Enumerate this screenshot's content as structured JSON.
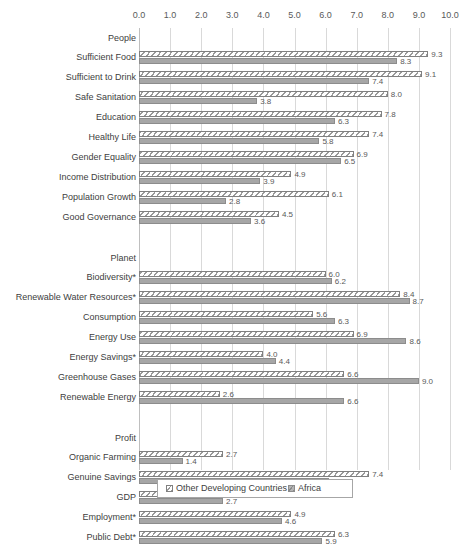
{
  "chart_data": {
    "type": "bar",
    "orientation": "horizontal",
    "title": "",
    "xlabel": "",
    "ylabel": "",
    "xlim": [
      0,
      10
    ],
    "xticks": [
      "0.0",
      "1.0",
      "2.0",
      "3.0",
      "4.0",
      "5.0",
      "6.0",
      "7.0",
      "8.0",
      "9.0",
      "10.0"
    ],
    "grid": true,
    "legend_position": "bottom",
    "series": [
      {
        "name": "Other Developing Countries",
        "pattern": "diagonal-hatch"
      },
      {
        "name": "Africa",
        "pattern": "solid-gray"
      }
    ],
    "groups": [
      {
        "label": "People",
        "categories": [
          {
            "label": "Sufficient Food",
            "values": [
              9.3,
              8.3
            ],
            "value_labels": [
              "9.3",
              "8.3"
            ]
          },
          {
            "label": "Sufficient to Drink",
            "values": [
              9.1,
              7.4
            ],
            "value_labels": [
              "9.1",
              "7.4"
            ]
          },
          {
            "label": "Safe Sanitation",
            "values": [
              8.0,
              3.8
            ],
            "value_labels": [
              "8.0",
              "3.8"
            ]
          },
          {
            "label": "Education",
            "values": [
              7.8,
              6.3
            ],
            "value_labels": [
              "7.8",
              "6.3"
            ]
          },
          {
            "label": "Healthy Life",
            "values": [
              7.4,
              5.8
            ],
            "value_labels": [
              "7.4",
              "5.8"
            ]
          },
          {
            "label": "Gender Equality",
            "values": [
              6.9,
              6.5
            ],
            "value_labels": [
              "6.9",
              "6.5"
            ]
          },
          {
            "label": "Income Distribution",
            "values": [
              4.9,
              3.9
            ],
            "value_labels": [
              "4.9",
              "3.9"
            ]
          },
          {
            "label": "Population Growth",
            "values": [
              6.1,
              2.8
            ],
            "value_labels": [
              "6.1",
              "2.8"
            ]
          },
          {
            "label": "Good Governance",
            "values": [
              4.5,
              3.6
            ],
            "value_labels": [
              "4.5",
              "3.6"
            ]
          }
        ]
      },
      {
        "label": "Planet",
        "categories": [
          {
            "label": "Biodiversity*",
            "values": [
              6.0,
              6.2
            ],
            "value_labels": [
              "6.0",
              "6.2"
            ]
          },
          {
            "label": "Renewable Water Resources*",
            "values": [
              8.4,
              8.7
            ],
            "value_labels": [
              "8.4",
              "8.7"
            ]
          },
          {
            "label": "Consumption",
            "values": [
              5.6,
              6.3
            ],
            "value_labels": [
              "5.6",
              "6.3"
            ]
          },
          {
            "label": "Energy Use",
            "values": [
              6.9,
              8.6
            ],
            "value_labels": [
              "6.9",
              "8.6"
            ]
          },
          {
            "label": "Energy Savings*",
            "values": [
              4.0,
              4.4
            ],
            "value_labels": [
              "4.0",
              "4.4"
            ]
          },
          {
            "label": "Greenhouse Gases",
            "values": [
              6.6,
              9.0
            ],
            "value_labels": [
              "6.6",
              "9.0"
            ]
          },
          {
            "label": "Renewable Energy",
            "values": [
              2.6,
              6.6
            ],
            "value_labels": [
              "2.6",
              "6.6"
            ]
          }
        ]
      },
      {
        "label": "Profit",
        "categories": [
          {
            "label": "Organic Farming",
            "values": [
              2.7,
              1.4
            ],
            "value_labels": [
              "2.7",
              "1.4"
            ]
          },
          {
            "label": "Genuine Savings",
            "values": [
              7.4,
              6.1
            ],
            "value_labels": [
              "7.4",
              "6.1"
            ]
          },
          {
            "label": "GDP",
            "values": [
              5.6,
              2.7
            ],
            "value_labels": [
              "5.6",
              "2.7"
            ]
          },
          {
            "label": "Employment*",
            "values": [
              4.9,
              4.6
            ],
            "value_labels": [
              "4.9",
              "4.6"
            ]
          },
          {
            "label": "Public Debt*",
            "values": [
              6.3,
              5.9
            ],
            "value_labels": [
              "6.3",
              "5.9"
            ]
          }
        ]
      }
    ]
  },
  "colors": {
    "series1_line": "#808080",
    "series2_fill": "#a6a6a6",
    "gridline": "#d9d9d9",
    "text": "#404040"
  }
}
